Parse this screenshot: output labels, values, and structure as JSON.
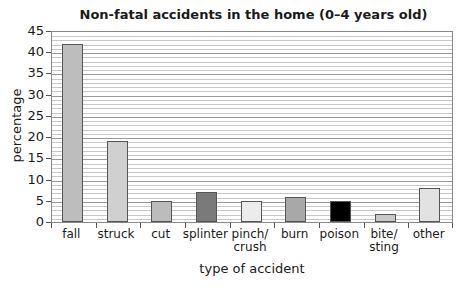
{
  "chart_data": {
    "type": "bar",
    "title": "Non-fatal accidents in the home (0–4 years old)",
    "xlabel": "type of accident",
    "ylabel": "percentage",
    "ylim": [
      0,
      45
    ],
    "yticks": [
      0,
      5,
      10,
      15,
      20,
      25,
      30,
      35,
      40,
      45
    ],
    "grid": true,
    "categories": [
      "fall",
      "struck",
      "cut",
      "splinter",
      "pinch/ crush",
      "burn",
      "poison",
      "bite/ sting",
      "other"
    ],
    "values": [
      42,
      19,
      5,
      7,
      5,
      6,
      5,
      2,
      8
    ],
    "colors": [
      "#bdbdbd",
      "#d0d0d0",
      "#bcbcbc",
      "#7a7a7a",
      "#ececec",
      "#a8a8a8",
      "#000000",
      "#c9c9c9",
      "#e2e2e2"
    ]
  }
}
